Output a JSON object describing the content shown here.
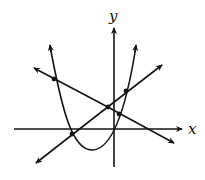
{
  "figure": {
    "type": "coordinate-graph",
    "x_axis_label": "x",
    "y_axis_label": "y",
    "colors": {
      "ink": "#141414",
      "background": "#ffffff"
    }
  },
  "elements": {
    "parabola": {
      "description": "upward-opening parabola with arrowheads on both arms",
      "vertex_px": [
        92,
        150
      ]
    },
    "line_decreasing": {
      "description": "line with negative slope, arrowheads at both ends"
    },
    "line_increasing": {
      "description": "line with positive slope, arrowheads at both ends"
    },
    "intersection_points": [
      {
        "id": "p1",
        "between": "parabola & decreasing line (left)",
        "px": [
          54,
          79
        ]
      },
      {
        "id": "p2",
        "between": "decreasing line & increasing line",
        "px": [
          108,
          107
        ]
      },
      {
        "id": "p3",
        "between": "parabola & increasing line (right)",
        "px": [
          126,
          91
        ]
      },
      {
        "id": "p4",
        "between": "parabola & decreasing line (right)",
        "px": [
          119,
          114
        ]
      },
      {
        "id": "p5",
        "between": "parabola & increasing line (left, on x-axis)",
        "px": [
          72,
          134
        ]
      }
    ]
  }
}
